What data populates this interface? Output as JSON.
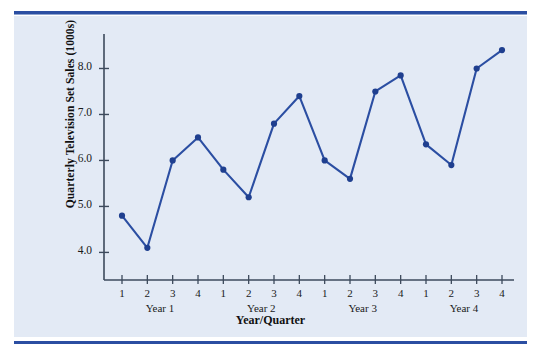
{
  "chart_data": {
    "type": "line",
    "title": "",
    "xlabel": "Year/Quarter",
    "ylabel": "Quarterly Television Set Sales (1000s)",
    "categories": [
      "1",
      "2",
      "3",
      "4",
      "1",
      "2",
      "3",
      "4",
      "1",
      "2",
      "3",
      "4",
      "1",
      "2",
      "3",
      "4"
    ],
    "group_labels": [
      "Year 1",
      "Year 2",
      "Year 3",
      "Year 4"
    ],
    "values": [
      4.8,
      4.1,
      6.0,
      6.5,
      5.8,
      5.2,
      6.8,
      7.4,
      6.0,
      5.6,
      7.5,
      7.85,
      6.35,
      5.9,
      8.0,
      8.4
    ],
    "ytick_labels": [
      "8.0",
      "7.0",
      "6.0",
      "5.0",
      "4.0"
    ],
    "ytick_values": [
      8.0,
      7.0,
      6.0,
      5.0,
      4.0
    ],
    "ylim": [
      3.4,
      8.75
    ],
    "xlim": [
      0.4,
      16.6
    ],
    "grid": false,
    "legend": false,
    "marker": "circle",
    "series": [
      {
        "name": "Quarterly Television Set Sales (1000s)",
        "values": [
          4.8,
          4.1,
          6.0,
          6.5,
          5.8,
          5.2,
          6.8,
          7.4,
          6.0,
          5.6,
          7.5,
          7.85,
          6.35,
          5.9,
          8.0,
          8.4
        ]
      }
    ]
  },
  "colors": {
    "line": "#2b4ea2",
    "marker": "#1f3f8f",
    "axis": "#3d4a5c",
    "panel_background": "#e3eaf5",
    "rule": "#2b4ea2",
    "text": "#111111"
  },
  "axes": {
    "y_title": "Quarterly Television Set Sales (1000s)",
    "x_title": "Year/Quarter"
  }
}
